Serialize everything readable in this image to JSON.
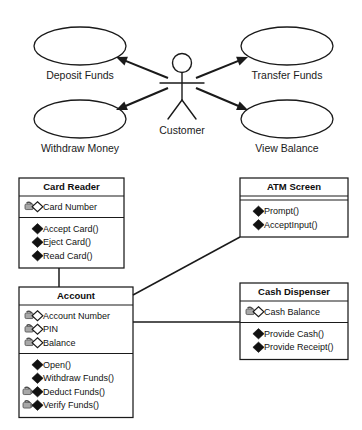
{
  "diagram": {
    "colors": {
      "stroke": "#1a1a1a",
      "fill": "#ffffff",
      "lock_body": "#a8a8a8",
      "lock_outline": "#4d4d4d",
      "diamond_filled": "#111111"
    },
    "use_case": {
      "actor": {
        "name": "actor-customer",
        "label": "Customer"
      },
      "use_cases": [
        {
          "id": "deposit-funds",
          "label": "Deposit Funds",
          "cx": 80,
          "cy": 46,
          "rx": 46,
          "ry": 19,
          "label_x": 80,
          "label_y": 76
        },
        {
          "id": "transfer-funds",
          "label": "Transfer Funds",
          "cx": 287,
          "cy": 46,
          "rx": 46,
          "ry": 19,
          "label_x": 287,
          "label_y": 76
        },
        {
          "id": "withdraw-money",
          "label": "Withdraw Money",
          "cx": 80,
          "cy": 119,
          "rx": 46,
          "ry": 19,
          "label_x": 80,
          "label_y": 149
        },
        {
          "id": "view-balance",
          "label": "View Balance",
          "cx": 287,
          "cy": 119,
          "rx": 46,
          "ry": 19,
          "label_x": 287,
          "label_y": 149
        }
      ],
      "associations": [
        {
          "id": "assoc-deposit",
          "from": "actor-customer",
          "to": "deposit-funds"
        },
        {
          "id": "assoc-transfer",
          "from": "actor-customer",
          "to": "transfer-funds"
        },
        {
          "id": "assoc-withdraw",
          "from": "actor-customer",
          "to": "withdraw-money"
        },
        {
          "id": "assoc-view-balance",
          "from": "actor-customer",
          "to": "view-balance"
        }
      ]
    },
    "classes": [
      {
        "id": "card-reader",
        "name": "Card Reader",
        "x": 19,
        "y": 178,
        "w": 105,
        "title_h": 18,
        "attributes": [
          {
            "label": "Card Number",
            "visibility": "private-lock",
            "marker": "open-diamond"
          }
        ],
        "methods": [
          {
            "label": "Accept Card()",
            "visibility": "public",
            "marker": "filled-diamond"
          },
          {
            "label": "Eject Card()",
            "visibility": "public",
            "marker": "filled-diamond"
          },
          {
            "label": "Read Card()",
            "visibility": "public",
            "marker": "filled-diamond"
          }
        ]
      },
      {
        "id": "atm-screen",
        "name": "ATM Screen",
        "x": 240,
        "y": 178,
        "w": 108,
        "title_h": 18,
        "attributes": [],
        "methods": [
          {
            "label": "Prompt()",
            "visibility": "public",
            "marker": "filled-diamond"
          },
          {
            "label": "AcceptInput()",
            "visibility": "public",
            "marker": "filled-diamond"
          }
        ]
      },
      {
        "id": "account",
        "name": "Account",
        "x": 19,
        "y": 287,
        "w": 114,
        "title_h": 18,
        "attributes": [
          {
            "label": "Account Number",
            "visibility": "private-lock",
            "marker": "open-diamond"
          },
          {
            "label": "PIN",
            "visibility": "private-lock",
            "marker": "open-diamond"
          },
          {
            "label": "Balance",
            "visibility": "private-lock",
            "marker": "open-diamond"
          }
        ],
        "methods": [
          {
            "label": "Open()",
            "visibility": "public",
            "marker": "filled-diamond"
          },
          {
            "label": "Withdraw Funds()",
            "visibility": "public",
            "marker": "filled-diamond"
          },
          {
            "label": "Deduct Funds()",
            "visibility": "private-lock",
            "marker": "filled-diamond"
          },
          {
            "label": "Verify Funds()",
            "visibility": "private-lock",
            "marker": "filled-diamond"
          }
        ]
      },
      {
        "id": "cash-dispenser",
        "name": "Cash Dispenser",
        "x": 240,
        "y": 283,
        "w": 108,
        "title_h": 18,
        "attributes": [
          {
            "label": "Cash Balance",
            "visibility": "private-lock",
            "marker": "open-diamond"
          }
        ],
        "methods": [
          {
            "label": "Provide Cash()",
            "visibility": "public",
            "marker": "filled-diamond"
          },
          {
            "label": "Provide Receipt()",
            "visibility": "public",
            "marker": "filled-diamond"
          }
        ]
      }
    ],
    "connectors": [
      {
        "id": "conn-cardreader-account",
        "from": "card-reader",
        "to": "account",
        "kind": "association"
      },
      {
        "id": "conn-account-atmscreen",
        "from": "account",
        "to": "atm-screen",
        "kind": "association"
      },
      {
        "id": "conn-account-cashdispenser",
        "from": "account",
        "to": "cash-dispenser",
        "kind": "association"
      }
    ]
  }
}
